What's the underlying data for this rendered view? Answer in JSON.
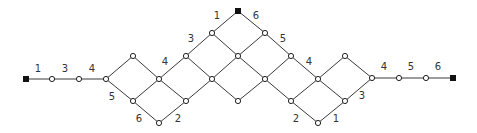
{
  "diagram": {
    "type": "lattice-path-graph",
    "nodes": {
      "S0": {
        "x": 26,
        "y": 79,
        "terminal": true
      },
      "a1": {
        "x": 52,
        "y": 79
      },
      "a2": {
        "x": 79,
        "y": 79
      },
      "A": {
        "x": 106,
        "y": 79
      },
      "B": {
        "x": 133,
        "y": 56
      },
      "C": {
        "x": 133,
        "y": 101
      },
      "D": {
        "x": 159,
        "y": 79
      },
      "E": {
        "x": 159,
        "y": 123
      },
      "F": {
        "x": 186,
        "y": 56
      },
      "G": {
        "x": 186,
        "y": 101
      },
      "H": {
        "x": 212,
        "y": 33
      },
      "I": {
        "x": 212,
        "y": 79
      },
      "J": {
        "x": 238,
        "y": 11,
        "terminal": true
      },
      "K": {
        "x": 238,
        "y": 56
      },
      "L": {
        "x": 238,
        "y": 101
      },
      "M": {
        "x": 265,
        "y": 33
      },
      "N": {
        "x": 265,
        "y": 79
      },
      "O": {
        "x": 291,
        "y": 56
      },
      "P": {
        "x": 291,
        "y": 101
      },
      "Q": {
        "x": 318,
        "y": 79
      },
      "R": {
        "x": 318,
        "y": 123
      },
      "S": {
        "x": 345,
        "y": 56
      },
      "T": {
        "x": 345,
        "y": 101
      },
      "U": {
        "x": 372,
        "y": 78
      },
      "b1": {
        "x": 399,
        "y": 78
      },
      "b2": {
        "x": 426,
        "y": 78
      },
      "S1": {
        "x": 453,
        "y": 78,
        "terminal": true
      }
    },
    "edges": [
      [
        "S0",
        "a1"
      ],
      [
        "a1",
        "a2"
      ],
      [
        "a2",
        "A"
      ],
      [
        "A",
        "B"
      ],
      [
        "A",
        "C"
      ],
      [
        "B",
        "D"
      ],
      [
        "C",
        "D"
      ],
      [
        "C",
        "E"
      ],
      [
        "D",
        "F"
      ],
      [
        "D",
        "G"
      ],
      [
        "E",
        "G"
      ],
      [
        "F",
        "H"
      ],
      [
        "F",
        "I"
      ],
      [
        "G",
        "I"
      ],
      [
        "H",
        "J"
      ],
      [
        "H",
        "K"
      ],
      [
        "I",
        "K"
      ],
      [
        "I",
        "L"
      ],
      [
        "J",
        "M"
      ],
      [
        "K",
        "M"
      ],
      [
        "K",
        "N"
      ],
      [
        "L",
        "N"
      ],
      [
        "M",
        "O"
      ],
      [
        "N",
        "O"
      ],
      [
        "N",
        "P"
      ],
      [
        "O",
        "Q"
      ],
      [
        "P",
        "Q"
      ],
      [
        "P",
        "R"
      ],
      [
        "Q",
        "S"
      ],
      [
        "Q",
        "T"
      ],
      [
        "R",
        "T"
      ],
      [
        "S",
        "U"
      ],
      [
        "T",
        "U"
      ],
      [
        "U",
        "b1"
      ],
      [
        "b1",
        "b2"
      ],
      [
        "b2",
        "S1"
      ]
    ],
    "labels": [
      {
        "text": "1",
        "x": 38,
        "y": 72
      },
      {
        "text": "3",
        "x": 65,
        "y": 72
      },
      {
        "text": "4",
        "x": 92,
        "y": 72
      },
      {
        "text": "5",
        "x": 112,
        "y": 100
      },
      {
        "text": "6",
        "x": 139,
        "y": 122
      },
      {
        "text": "2",
        "x": 178,
        "y": 122
      },
      {
        "text": "4",
        "x": 165,
        "y": 65
      },
      {
        "text": "3",
        "x": 191,
        "y": 42
      },
      {
        "text": "1",
        "x": 217,
        "y": 19
      },
      {
        "text": "6",
        "x": 256,
        "y": 19
      },
      {
        "text": "5",
        "x": 283,
        "y": 42
      },
      {
        "text": "4",
        "x": 309,
        "y": 65
      },
      {
        "text": "2",
        "x": 296,
        "y": 122
      },
      {
        "text": "1",
        "x": 336,
        "y": 122
      },
      {
        "text": "3",
        "x": 362,
        "y": 99
      },
      {
        "text": "4",
        "x": 384,
        "y": 70
      },
      {
        "text": "5",
        "x": 411,
        "y": 70
      },
      {
        "text": "6",
        "x": 438,
        "y": 70
      }
    ]
  }
}
